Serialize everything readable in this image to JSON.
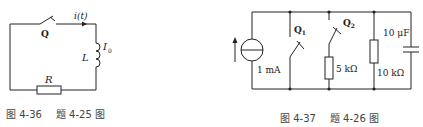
{
  "figures": [
    {
      "id": "fig-4-36",
      "caption": {
        "figure": "图 4-36",
        "problem": "题 4-25 图"
      },
      "labels": {
        "switch": "Q",
        "current": "i(t)",
        "inductor": "L",
        "initial_current": "I",
        "initial_current_sub": "0",
        "resistor": "R"
      },
      "components": [
        "switch-Q",
        "inductor-L",
        "resistor-R"
      ]
    },
    {
      "id": "fig-4-37",
      "caption": {
        "figure": "图 4-37",
        "problem": "题 4-26 图"
      },
      "labels": {
        "source": "1 mA",
        "switch1": "Q",
        "switch1_sub": "1",
        "switch2": "Q",
        "switch2_sub": "2",
        "resistor1": "5 kΩ",
        "resistor2": "10 kΩ",
        "capacitor": "10 μF"
      },
      "components": [
        "current-source-1mA",
        "switch-Q1",
        "switch-Q2",
        "resistor-5k",
        "resistor-10k",
        "capacitor-10uF"
      ]
    }
  ],
  "colors": {
    "line": "#222222",
    "caption": "#444444",
    "background": "#ffffff"
  }
}
